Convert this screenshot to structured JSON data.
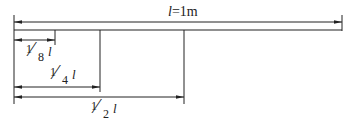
{
  "title_label": {
    "var": "l",
    "text": "=1m"
  },
  "dimensions": [
    {
      "id": "full",
      "num": "",
      "den": "",
      "var": "l",
      "value": "1m"
    },
    {
      "id": "eighth",
      "num": "1",
      "den": "8",
      "var": "l"
    },
    {
      "id": "quarter",
      "num": "1",
      "den": "4",
      "var": "l"
    },
    {
      "id": "half",
      "num": "1",
      "den": "2",
      "var": "l"
    }
  ],
  "colors": {
    "line": "#222222",
    "background": "#ffffff"
  }
}
